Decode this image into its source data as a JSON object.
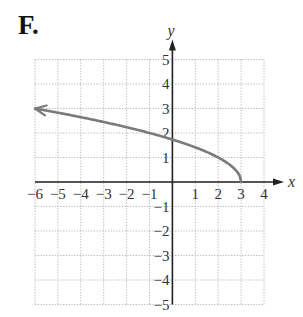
{
  "panel_label": "F.",
  "chart_data": {
    "type": "line",
    "title": "",
    "function": "y = sqrt(3 - x)",
    "xlabel": "x",
    "ylabel": "y",
    "xlim": [
      -6,
      4
    ],
    "ylim": [
      -5,
      5
    ],
    "grid": true,
    "grid_style": "dotted",
    "x_ticks": [
      -6,
      -5,
      -4,
      -3,
      -2,
      -1,
      1,
      2,
      3,
      4
    ],
    "x_tick_labels": [
      "−6",
      "−5",
      "−4",
      "−3",
      "−2",
      "−1",
      "1",
      "2",
      "3",
      "4"
    ],
    "y_ticks": [
      5,
      4,
      3,
      2,
      1,
      -1,
      -2,
      -3,
      -4,
      -5
    ],
    "y_tick_labels": [
      "5",
      "4",
      "3",
      "2",
      "1",
      "−1",
      "−2",
      "−3",
      "−4",
      "−5"
    ],
    "series": [
      {
        "name": "curve",
        "x": [
          -6,
          -5,
          -4,
          -3,
          -2,
          -1,
          0,
          1,
          2,
          2.5,
          2.75,
          3
        ],
        "y": [
          3,
          2.828,
          2.646,
          2.449,
          2.236,
          2,
          1.732,
          1.414,
          1,
          0.707,
          0.5,
          0
        ],
        "endpoint_left": "arrow",
        "endpoint_right": "closed-end at (3, 0)"
      }
    ],
    "colors": {
      "curve": "#7a7a7a",
      "axes": "#222222",
      "grid": "#b5b5b5",
      "text": "#333333"
    }
  }
}
